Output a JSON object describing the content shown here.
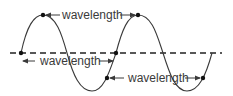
{
  "diagram": {
    "type": "wavelength-illustration",
    "colors": {
      "wave": "#3a3a3a",
      "axis": "#222222",
      "text": "#3a3a3a",
      "background": "#ffffff"
    },
    "labels": {
      "crest_to_crest": "wavelength",
      "zero_to_zero": "wavelength",
      "trough_point_to_point": "wavelength"
    },
    "points": [
      {
        "name": "start-zero",
        "x": 21,
        "y": 53
      },
      {
        "name": "crest-1",
        "x": 43,
        "y": 15
      },
      {
        "name": "crest-2",
        "x": 138,
        "y": 15
      },
      {
        "name": "mid-zero",
        "x": 116,
        "y": 53
      },
      {
        "name": "trough-point-1",
        "x": 107,
        "y": 78
      },
      {
        "name": "trough-point-2",
        "x": 203,
        "y": 78
      }
    ]
  }
}
